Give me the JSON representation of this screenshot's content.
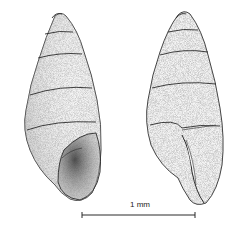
{
  "figure": {
    "specimens": [
      {
        "view": "apertural"
      },
      {
        "view": "lateral"
      }
    ],
    "scale_bar": {
      "label": "1 mm"
    },
    "colors": {
      "ink": "#2a2a2a",
      "stipple": "#555555",
      "background": "#ffffff"
    }
  }
}
